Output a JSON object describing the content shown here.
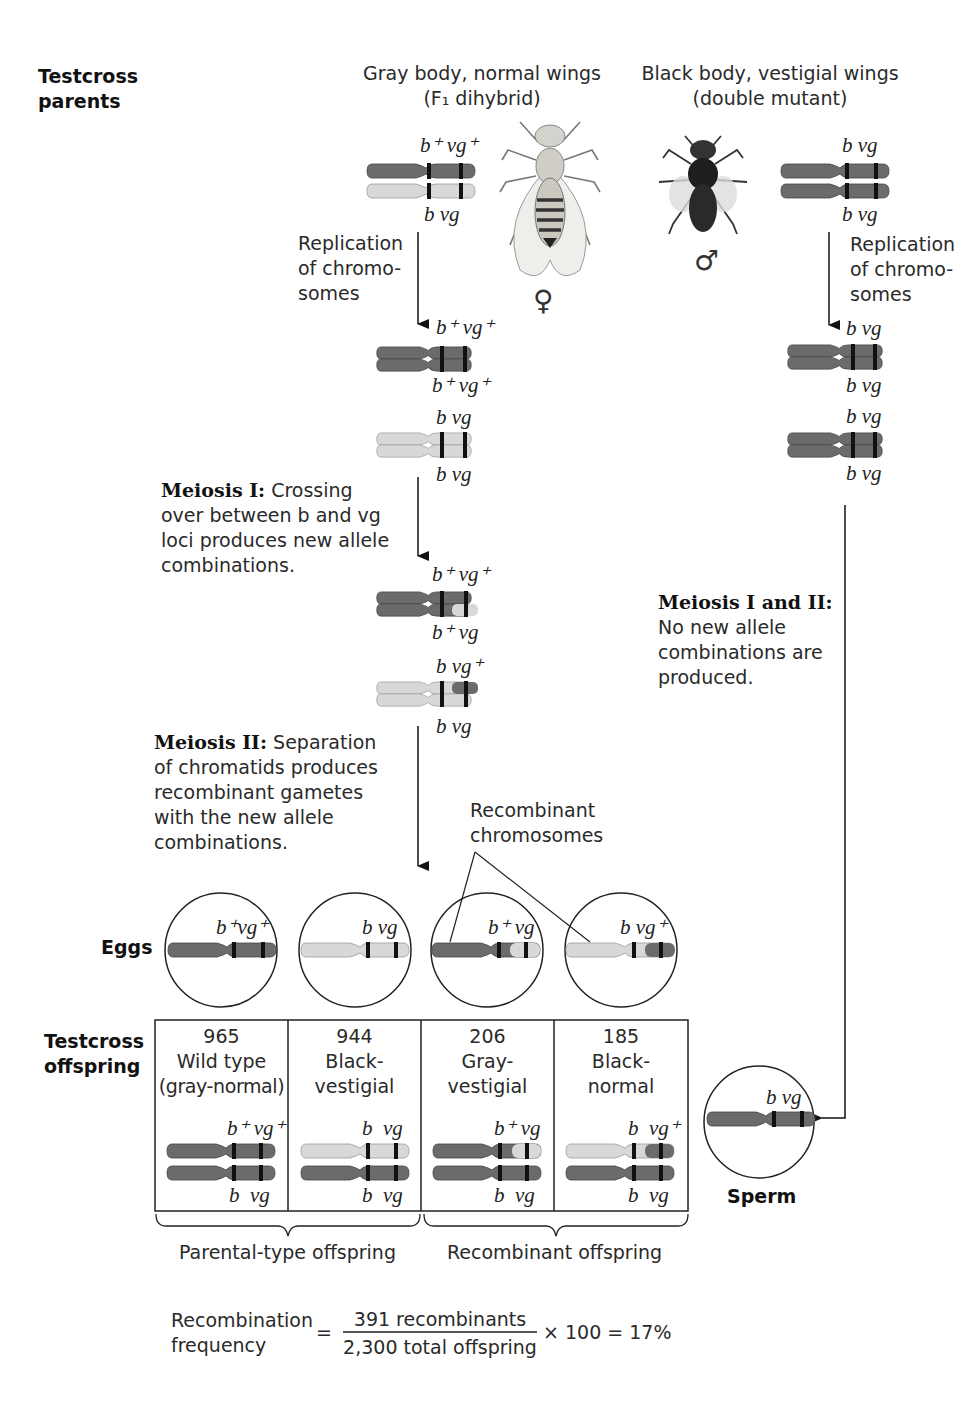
{
  "labels": {
    "testcross_parents": [
      "Testcross",
      "parents"
    ],
    "eggs": "Eggs",
    "testcross_offspring": [
      "Testcross",
      "offspring"
    ],
    "sperm": "Sperm"
  },
  "female_parent": {
    "title": [
      "Gray body, normal wings",
      "(F₁ dihybrid)"
    ],
    "symbol": "♀",
    "alleles_top": "b⁺ vg⁺",
    "alleles_bottom": "b vg",
    "replicated_top": [
      "b⁺ vg⁺",
      "b⁺ vg⁺"
    ],
    "replicated_bottom": [
      "b vg",
      "b vg"
    ],
    "crossover_top": [
      "b⁺ vg⁺",
      "b⁺ vg"
    ],
    "crossover_bottom": [
      "b vg⁺",
      "b vg"
    ]
  },
  "male_parent": {
    "title": [
      "Black body, vestigial wings",
      "(double mutant)"
    ],
    "symbol": "♂",
    "alleles_top": "b vg",
    "alleles_bottom": "b vg",
    "replicated": [
      "b vg",
      "b vg",
      "b vg",
      "b vg"
    ]
  },
  "steps": {
    "replication_left": [
      "Replication",
      "of chromo-",
      "somes"
    ],
    "replication_right": [
      "Replication",
      "of chromo-",
      "somes"
    ],
    "meiosis1": {
      "bold": "Meiosis I:",
      "lines": [
        " Crossing",
        "over between b and vg",
        "loci produces new allele",
        "combinations."
      ]
    },
    "meiosis2": {
      "bold": "Meiosis II:",
      "lines": [
        " Separation",
        "of chromatids produces",
        "recombinant gametes",
        "with the new allele",
        "combinations."
      ]
    },
    "meiosis_male": {
      "bold": "Meiosis I and II:",
      "lines": [
        "No new allele",
        "combinations are",
        "produced."
      ]
    },
    "recombinant_chromosomes": [
      "Recombinant",
      "chromosomes"
    ]
  },
  "eggs": [
    {
      "alleles": "b⁺vg⁺",
      "type": "parental"
    },
    {
      "alleles": "b vg",
      "type": "parental"
    },
    {
      "alleles": "b⁺ vg",
      "type": "recombinant"
    },
    {
      "alleles": "b vg⁺",
      "type": "recombinant"
    }
  ],
  "sperm": {
    "alleles": "b vg"
  },
  "offspring": [
    {
      "count": "965",
      "phenotype": [
        "Wild type",
        "(gray-normal)"
      ],
      "top": "b⁺ vg⁺",
      "bottom": "b  vg"
    },
    {
      "count": "944",
      "phenotype": [
        "Black-",
        "vestigial"
      ],
      "top": "b  vg",
      "bottom": "b  vg"
    },
    {
      "count": "206",
      "phenotype": [
        "Gray-",
        "vestigial"
      ],
      "top": "b⁺ vg",
      "bottom": "b  vg"
    },
    {
      "count": "185",
      "phenotype": [
        "Black-",
        "normal"
      ],
      "top": "b  vg⁺",
      "bottom": "b  vg"
    }
  ],
  "groups": {
    "parental": "Parental-type offspring",
    "recombinant": "Recombinant offspring"
  },
  "formula": {
    "lhs": [
      "Recombination",
      "frequency"
    ],
    "equals": "=",
    "numerator": "391 recombinants",
    "denominator": "2,300 total offspring",
    "rhs": "× 100 = 17%"
  },
  "colors": {
    "dark_chromosome": "#6b6b6b",
    "light_chromosome": "#d6d6d6",
    "band": "#111111",
    "line": "#222222"
  }
}
